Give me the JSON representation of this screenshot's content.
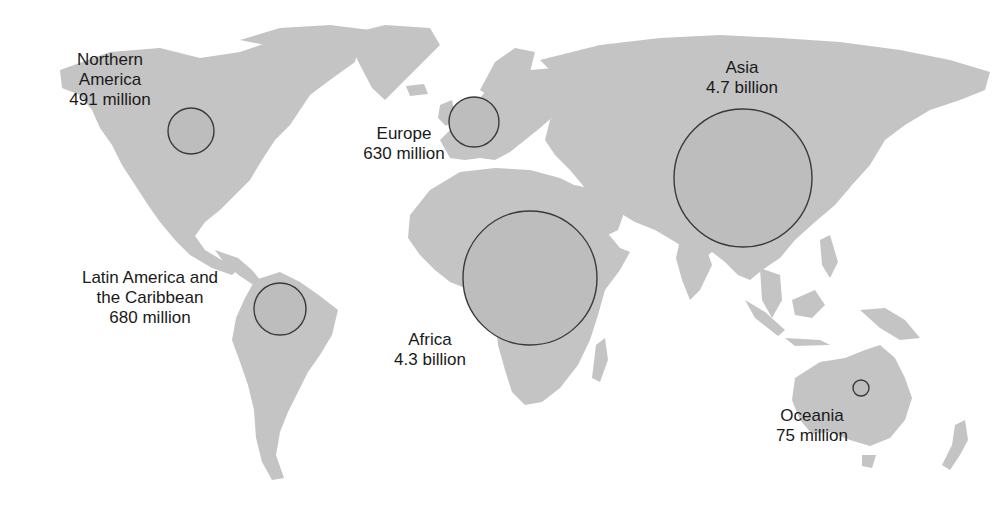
{
  "map": {
    "type": "proportional-symbol",
    "colors": {
      "land": "#c4c4c4",
      "bubble_fill": "#bdbdbd",
      "bubble_stroke": "#3a3a3a",
      "text": "#1a1a1a",
      "background": "#ffffff"
    },
    "regions": [
      {
        "id": "northern-america",
        "name_lines": [
          "Northern",
          "America"
        ],
        "value": "491 million",
        "population_millions": 491,
        "circle": {
          "cx": 191,
          "cy": 131,
          "r": 23
        }
      },
      {
        "id": "europe",
        "name_lines": [
          "Europe"
        ],
        "value": "630 million",
        "population_millions": 630,
        "circle": {
          "cx": 474,
          "cy": 122,
          "r": 25
        }
      },
      {
        "id": "asia",
        "name_lines": [
          "Asia"
        ],
        "value": "4.7 billion",
        "population_millions": 4700,
        "circle": {
          "cx": 743,
          "cy": 178,
          "r": 69
        }
      },
      {
        "id": "latin-america",
        "name_lines": [
          "Latin America and",
          "the Caribbean"
        ],
        "value": "680 million",
        "population_millions": 680,
        "circle": {
          "cx": 280,
          "cy": 309,
          "r": 26
        }
      },
      {
        "id": "africa",
        "name_lines": [
          "Africa"
        ],
        "value": "4.3 billion",
        "population_millions": 4300,
        "circle": {
          "cx": 530,
          "cy": 278,
          "r": 67
        }
      },
      {
        "id": "oceania",
        "name_lines": [
          "Oceania"
        ],
        "value": "75 million",
        "population_millions": 75,
        "circle": {
          "cx": 861,
          "cy": 388,
          "r": 8
        }
      }
    ]
  }
}
